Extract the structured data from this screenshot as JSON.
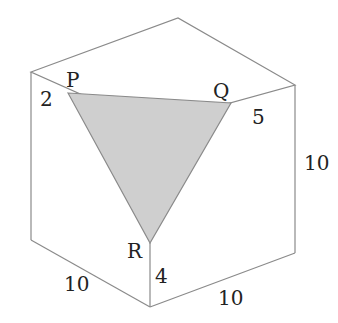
{
  "diagram": {
    "type": "cube-cross-section",
    "vertices": {
      "P": "P",
      "Q": "Q",
      "R": "R"
    },
    "edge_labels": {
      "p_offset": "2",
      "q_offset": "5",
      "r_offset": "4",
      "right_height": "10",
      "bottom_left_length": "10",
      "bottom_right_length": "10"
    },
    "colors": {
      "edge": "#8a8a8a",
      "triangle_fill": "#cfcfcf",
      "text": "#222222"
    }
  }
}
